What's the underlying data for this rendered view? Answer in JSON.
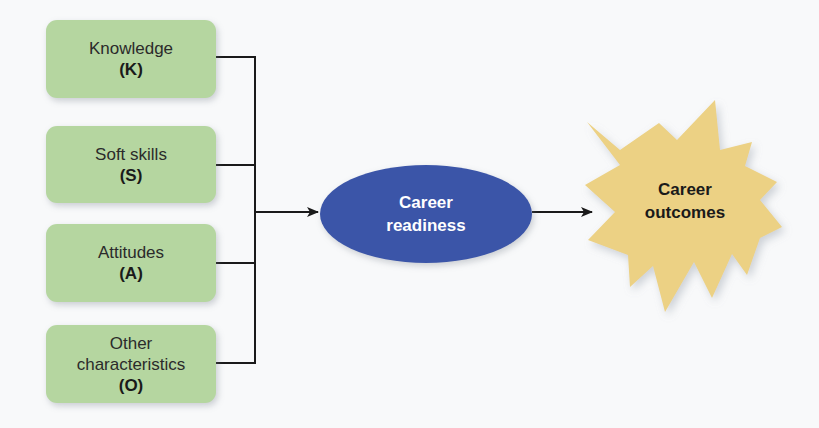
{
  "diagram": {
    "inputs": [
      {
        "label": "Knowledge",
        "abbr": "(K)"
      },
      {
        "label": "Soft skills",
        "abbr": "(S)"
      },
      {
        "label": "Attitudes",
        "abbr": "(A)"
      },
      {
        "label": "Other characteristics",
        "label_line1": "Other",
        "label_line2": "characteristics",
        "abbr": "(O)"
      }
    ],
    "center": {
      "line1": "Career",
      "line2": "readiness"
    },
    "outcome": {
      "line1": "Career",
      "line2": "outcomes"
    },
    "colors": {
      "input_box": "#b5d6a0",
      "center_ellipse": "#3b55a8",
      "outcome_burst": "#ecd184",
      "connector": "#1a1a1a"
    }
  }
}
